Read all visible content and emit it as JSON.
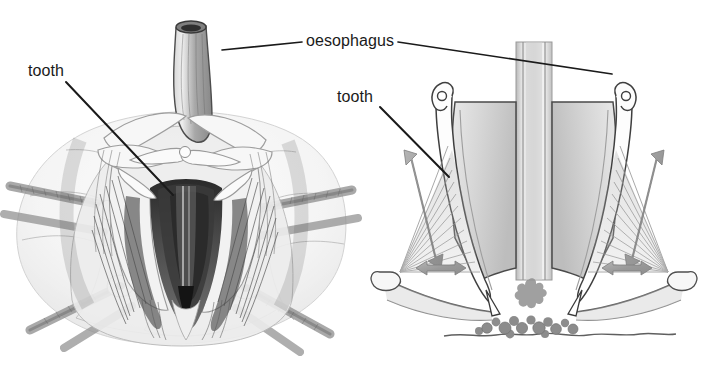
{
  "figure": {
    "background_color": "#ffffff",
    "width": 722,
    "height": 367,
    "panels": [
      {
        "id": "left-panel",
        "name": "oral-view-drawing",
        "description": "Pencil drawing of the oral surface of a sea urchin showing the Aristotle's lantern, mouth opening, teeth, radiating muscles, test plates and spines",
        "view": "oral view"
      },
      {
        "id": "right-panel",
        "name": "cross-section-schematic",
        "description": "Schematic vertical cross-section of the Aristotle's lantern showing jaws, teeth, retractor and protractor muscles, oesophagus and food particles on the substrate",
        "view": "cross-section"
      }
    ]
  },
  "labels": [
    {
      "id": "oesophagus",
      "text": "oesophagus",
      "x": 306,
      "y": 33,
      "leaders": [
        {
          "from": [
            302,
            42
          ],
          "to": [
            222,
            50
          ]
        },
        {
          "from": [
            398,
            42
          ],
          "to": [
            612,
            74
          ]
        }
      ]
    },
    {
      "id": "tooth-left",
      "text": "tooth",
      "x": 28,
      "y": 63,
      "leaders": [
        {
          "from": [
            66,
            82
          ],
          "to": [
            173,
            195
          ]
        }
      ]
    },
    {
      "id": "tooth-right",
      "text": "tooth",
      "x": 337,
      "y": 89,
      "leaders": [
        {
          "from": [
            380,
            107
          ],
          "to": [
            449,
            177
          ]
        }
      ]
    }
  ],
  "annotations": {
    "arrows": [
      {
        "name": "left-retractor-arrow",
        "direction": "double-vertical-diagonal",
        "color": "#9a9a9a"
      },
      {
        "name": "right-retractor-arrow",
        "direction": "double-vertical-diagonal",
        "color": "#9a9a9a"
      },
      {
        "name": "left-protractor-arrow",
        "direction": "double-horizontal",
        "color": "#9a9a9a"
      },
      {
        "name": "right-protractor-arrow",
        "direction": "double-horizontal",
        "color": "#9a9a9a"
      }
    ],
    "substrate": {
      "name": "substrate-line",
      "color": "#6b6b6b"
    },
    "food_particles": {
      "name": "food-particles",
      "color": "#8a8a8a",
      "count": 14
    }
  },
  "colors": {
    "ink": "#1a1a1a",
    "pencil_dark": "#3c3c3c",
    "pencil_mid": "#888888",
    "pencil_light": "#c8c8c8",
    "arrow_gray": "#9a9a9a",
    "background": "#ffffff"
  }
}
